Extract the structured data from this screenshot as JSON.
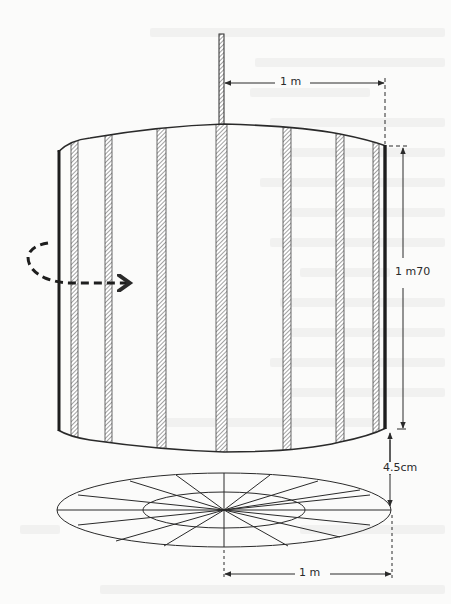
{
  "figure": {
    "labels": {
      "top_radius": "1 m",
      "height": "1 m70",
      "gap": "4.5cm",
      "bottom_radius": "1 m"
    },
    "icons": {
      "rotation_arrow": "curved-dashed-arrow-icon"
    },
    "colors": {
      "paper": "#fbfbfa",
      "ink": "#2a2a2a",
      "hatch": "#8a8a8a",
      "bleed_through": "#f1f1f0"
    },
    "slats_count_visible": 8,
    "disk_radial_segments": 16
  }
}
